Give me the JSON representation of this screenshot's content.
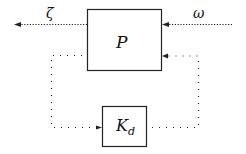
{
  "diagram": {
    "blocks": [
      {
        "id": "P",
        "label": "P"
      },
      {
        "id": "Kd",
        "label": "K",
        "subscript": "d"
      }
    ],
    "signals": {
      "output": "ζ",
      "input": "ω"
    },
    "colors": {
      "line": "#222222",
      "background": "#ffffff"
    }
  }
}
